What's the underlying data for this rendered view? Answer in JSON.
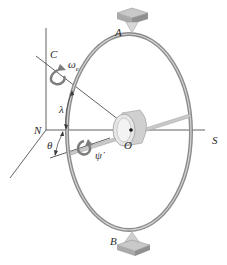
{
  "diagram": {
    "labels": {
      "A": "A",
      "B": "B",
      "C": "C",
      "N": "N",
      "S": "S",
      "O": "O",
      "omega": "ω",
      "omega_sub": "e",
      "lambda": "λ",
      "theta": "θ",
      "psi_dot": "ψ̇"
    },
    "colors": {
      "ring": "#8c8c8c",
      "ring_highlight": "#cfcfcf",
      "line": "#3a3a3a",
      "rotor": "#d9d9d9",
      "rotor_shadow": "#a8a8a8",
      "support_top": "#bdbdbd",
      "support_side": "#8f8f8f",
      "arrow": "#7d7d7d",
      "text": "#2a2a2a"
    }
  }
}
